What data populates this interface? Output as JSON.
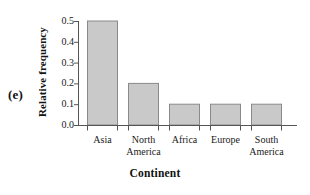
{
  "panel": {
    "label": "(e)"
  },
  "chart_data": {
    "type": "bar",
    "title": "",
    "xlabel": "Continent",
    "ylabel": "Relative frequency",
    "categories": [
      "Asia",
      "North America",
      "Africa",
      "Europe",
      "South America"
    ],
    "category_lines": [
      [
        "Asia",
        ""
      ],
      [
        "North",
        "America"
      ],
      [
        "Africa",
        ""
      ],
      [
        "Europe",
        ""
      ],
      [
        "South",
        "America"
      ]
    ],
    "values": [
      0.5,
      0.2,
      0.1,
      0.1,
      0.1
    ],
    "ylim": [
      0.0,
      0.5
    ],
    "ytick_values": [
      0.0,
      0.1,
      0.2,
      0.3,
      0.4,
      0.5
    ],
    "ytick_labels": [
      "0.0",
      "0.1",
      "0.2",
      "0.3",
      "0.4",
      "0.5"
    ],
    "grid": false,
    "legend": false,
    "legend_position": "none",
    "bar_fill_color": "#c9c9c9",
    "bar_edge_color": "#8a8a8a",
    "axis_color": "#555555",
    "background_color": "#ffffff"
  }
}
